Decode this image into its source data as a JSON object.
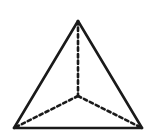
{
  "figure": {
    "name": "tetrahedron",
    "title": "Triangular pyramid (tetrahedron) wireframe",
    "canvas": {
      "width": 154,
      "height": 139,
      "background": "#ffffff"
    },
    "style": {
      "solid_stroke_color": "#1a1a1a",
      "solid_stroke_width": 2.6,
      "hidden_stroke_color": "#1a1a1a",
      "hidden_stroke_width": 2.6,
      "hidden_dash_pattern": "3.4 3.2",
      "line_cap": "round",
      "line_join": "miter"
    },
    "vertices": [
      {
        "id": "apex",
        "label": "apex",
        "x": 78,
        "y": 21,
        "visible": true
      },
      {
        "id": "front-left",
        "label": "front left base",
        "x": 14,
        "y": 128,
        "visible": true
      },
      {
        "id": "front-right",
        "label": "front right base",
        "x": 142,
        "y": 128,
        "visible": true
      },
      {
        "id": "back",
        "label": "hidden back base",
        "x": 78,
        "y": 96,
        "visible": false
      }
    ],
    "solid_edges": [
      {
        "id": "edge-apex-front-left",
        "label": "apex to front left",
        "from": "apex",
        "to": "front-left",
        "d": "M 78 21 L 14 128"
      },
      {
        "id": "edge-apex-front-right",
        "label": "apex to front right",
        "from": "apex",
        "to": "front-right",
        "d": "M 78 21 L 142 128"
      },
      {
        "id": "edge-base-front",
        "label": "front base edge",
        "from": "front-left",
        "to": "front-right",
        "d": "M 14 128 L 142 128"
      }
    ],
    "hidden_edges": [
      {
        "id": "edge-apex-back",
        "label": "apex to hidden back vertex",
        "from": "apex",
        "to": "back",
        "d": "M 78 21 L 78 96"
      },
      {
        "id": "edge-back-front-left",
        "label": "hidden back vertex to front left",
        "from": "back",
        "to": "front-left",
        "d": "M 78 96 L 14 128"
      },
      {
        "id": "edge-back-front-right",
        "label": "hidden back vertex to front right",
        "from": "back",
        "to": "front-right",
        "d": "M 78 96 L 142 128"
      }
    ]
  }
}
